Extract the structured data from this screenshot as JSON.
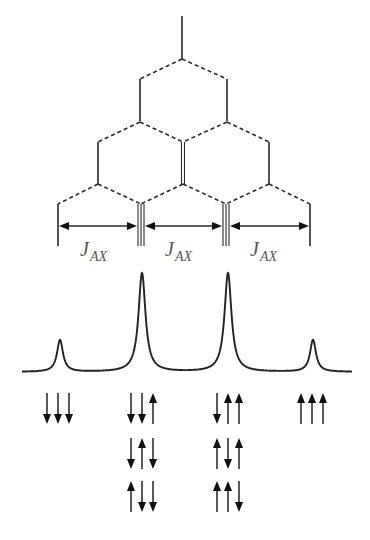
{
  "diagram": {
    "title": "",
    "type": "NMR splitting tree (A coupled to three equivalent X nuclei)",
    "colors": {
      "line": "#2a2a2a",
      "label": "#555555",
      "background": "#ffffff"
    },
    "tree": {
      "root": {
        "x": 182,
        "y_top": 16,
        "y_bottom": 59
      },
      "levels": [
        {
          "vertex_y": 59,
          "branch_y": 79,
          "drop_to": 121,
          "positions": [
            140,
            227
          ],
          "multiplicity": [
            1,
            1
          ]
        },
        {
          "vertex_y": 122,
          "branch_y": 142,
          "drop_to": 184,
          "positions": [
            98,
            183,
            269
          ],
          "multiplicity": [
            1,
            2,
            1
          ]
        },
        {
          "vertex_y": 184,
          "branch_y": 204,
          "drop_to": 246,
          "positions": [
            58,
            141,
            226,
            310
          ],
          "multiplicity": [
            1,
            3,
            3,
            1
          ]
        }
      ],
      "coupling_arrows_y": 226,
      "coupling_labels": [
        {
          "main": "J",
          "sub": "AX",
          "x": 80
        },
        {
          "main": "J",
          "sub": "AX",
          "x": 165
        },
        {
          "main": "J",
          "sub": "AX",
          "x": 250
        }
      ]
    },
    "spectrum": {
      "baseline_y": 372,
      "x_start": 22,
      "x_end": 352,
      "peaks": [
        {
          "x": 60,
          "top_y": 340,
          "relative_intensity": 1
        },
        {
          "x": 142,
          "top_y": 273,
          "relative_intensity": 3
        },
        {
          "x": 228,
          "top_y": 273,
          "relative_intensity": 3
        },
        {
          "x": 313,
          "top_y": 340,
          "relative_intensity": 1
        }
      ]
    },
    "spin_states": {
      "arrow_spacing": 11,
      "row_y": [
        393,
        438,
        481
      ],
      "arrow_length": 31,
      "columns": [
        {
          "center_x": 58,
          "states": [
            [
              "down",
              "down",
              "down"
            ]
          ]
        },
        {
          "center_x": 142,
          "states": [
            [
              "down",
              "down",
              "up"
            ],
            [
              "down",
              "up",
              "down"
            ],
            [
              "up",
              "down",
              "down"
            ]
          ]
        },
        {
          "center_x": 228,
          "states": [
            [
              "down",
              "up",
              "up"
            ],
            [
              "up",
              "down",
              "up"
            ],
            [
              "up",
              "up",
              "down"
            ]
          ]
        },
        {
          "center_x": 312,
          "states": [
            [
              "up",
              "up",
              "up"
            ]
          ]
        }
      ]
    }
  }
}
